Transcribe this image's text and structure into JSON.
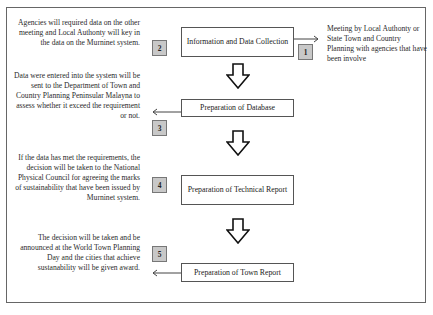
{
  "diagram": {
    "steps": [
      {
        "number": "1",
        "box_label": "Information and Data Collection",
        "description": "Meeting by Local Authonty or State Town and Country Planning with agencies that have been involve",
        "description_side": "right"
      },
      {
        "number": "2",
        "box_label": "",
        "description": "Agencies will required data on the other meeting and Local Authonty will key in the data on the Murninet system.",
        "description_side": "left"
      },
      {
        "number": "3",
        "box_label": "Preparation of Database",
        "description": "Data were entered into the system will be sent to the Department of Town and Country Planning Peninsular Malayna to assess whether it exceed the requirement or not.",
        "description_side": "left"
      },
      {
        "number": "4",
        "box_label": "Preparation of Technical Report",
        "description": "If the data has met the requirements, the decision will be taken to the National Physical Council for agreeing the marks of sustainability that have been issued by Murninet system.",
        "description_side": "left"
      },
      {
        "number": "5",
        "box_label": "Preparation of Town Report",
        "description": "The decision will be taken and be announced at the World Town Planning Day and the cities that achieve sustanability will be given award.",
        "description_side": "left"
      }
    ],
    "colors": {
      "frame_border": "#666666",
      "box_border": "#555555",
      "number_badge_fill": "#c8c8c8",
      "text": "#222222"
    }
  }
}
